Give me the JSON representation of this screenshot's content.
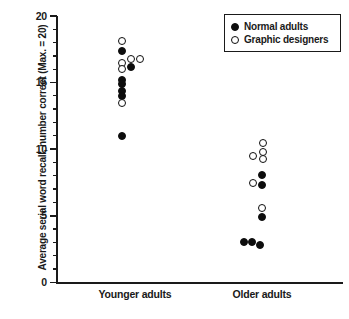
{
  "chart_data": {
    "type": "scatter",
    "title": "",
    "xlabel": "",
    "ylabel": "Average serial word recall, number correct (Max. = 20)",
    "ylim": [
      0,
      20
    ],
    "yticks": [
      0,
      5,
      10,
      15,
      20
    ],
    "ytick_labels": [
      "0",
      "5",
      "10",
      "15",
      "20"
    ],
    "minor_tick_interval": 1,
    "grid": false,
    "legend_position": "top-right",
    "categories": [
      "Younger adults",
      "Older adults"
    ],
    "series": [
      {
        "name": "Normal adults",
        "marker": "filled-circle",
        "color": "#0d0d0d",
        "points": [
          {
            "category": "Younger adults",
            "value": 17.4
          },
          {
            "category": "Younger adults",
            "value": 16.2
          },
          {
            "category": "Younger adults",
            "value": 15.2
          },
          {
            "category": "Younger adults",
            "value": 14.9
          },
          {
            "category": "Younger adults",
            "value": 14.4
          },
          {
            "category": "Younger adults",
            "value": 14.0
          },
          {
            "category": "Younger adults",
            "value": 11.0
          },
          {
            "category": "Older adults",
            "value": 8.1
          },
          {
            "category": "Older adults",
            "value": 7.3
          },
          {
            "category": "Older adults",
            "value": 4.9
          },
          {
            "category": "Older adults",
            "value": 3.0
          },
          {
            "category": "Older adults",
            "value": 3.0
          },
          {
            "category": "Older adults",
            "value": 2.8
          }
        ]
      },
      {
        "name": "Graphic designers",
        "marker": "open-circle",
        "color": "#ffffff",
        "points": [
          {
            "category": "Younger adults",
            "value": 18.1
          },
          {
            "category": "Younger adults",
            "value": 16.5
          },
          {
            "category": "Younger adults",
            "value": 16.8
          },
          {
            "category": "Younger adults",
            "value": 16.8
          },
          {
            "category": "Younger adults",
            "value": 16.0
          },
          {
            "category": "Younger adults",
            "value": 13.5
          },
          {
            "category": "Older adults",
            "value": 10.5
          },
          {
            "category": "Older adults",
            "value": 9.8
          },
          {
            "category": "Older adults",
            "value": 9.5
          },
          {
            "category": "Older adults",
            "value": 9.3
          },
          {
            "category": "Older adults",
            "value": 7.5
          },
          {
            "category": "Older adults",
            "value": 5.6
          }
        ]
      }
    ]
  },
  "axis": {
    "y_title": "Average serial word recall, number correct (Max. = 20)",
    "ticks": [
      {
        "label": "20",
        "value": 20
      },
      {
        "label": "15",
        "value": 15
      },
      {
        "label": "10",
        "value": 10
      },
      {
        "label": "5",
        "value": 5
      },
      {
        "label": "0",
        "value": 0
      }
    ]
  },
  "categories": [
    {
      "label": "Younger adults"
    },
    {
      "label": "Older adults"
    }
  ],
  "legend": {
    "items": [
      {
        "label": "Normal adults",
        "marker": "filled-circle"
      },
      {
        "label": "Graphic designers",
        "marker": "open-circle"
      }
    ]
  }
}
